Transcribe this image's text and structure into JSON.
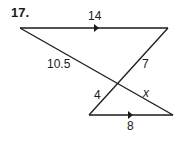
{
  "problem_number": "17.",
  "labels": {
    "top_side": "14",
    "left_diagonal_upper": "10.5",
    "right_diagonal_upper": "7",
    "left_diagonal_lower": "4",
    "right_diagonal_lower": "x",
    "bottom_side": "8"
  },
  "colors": {
    "line": "#1a1a1a",
    "background": "#ffffff"
  }
}
